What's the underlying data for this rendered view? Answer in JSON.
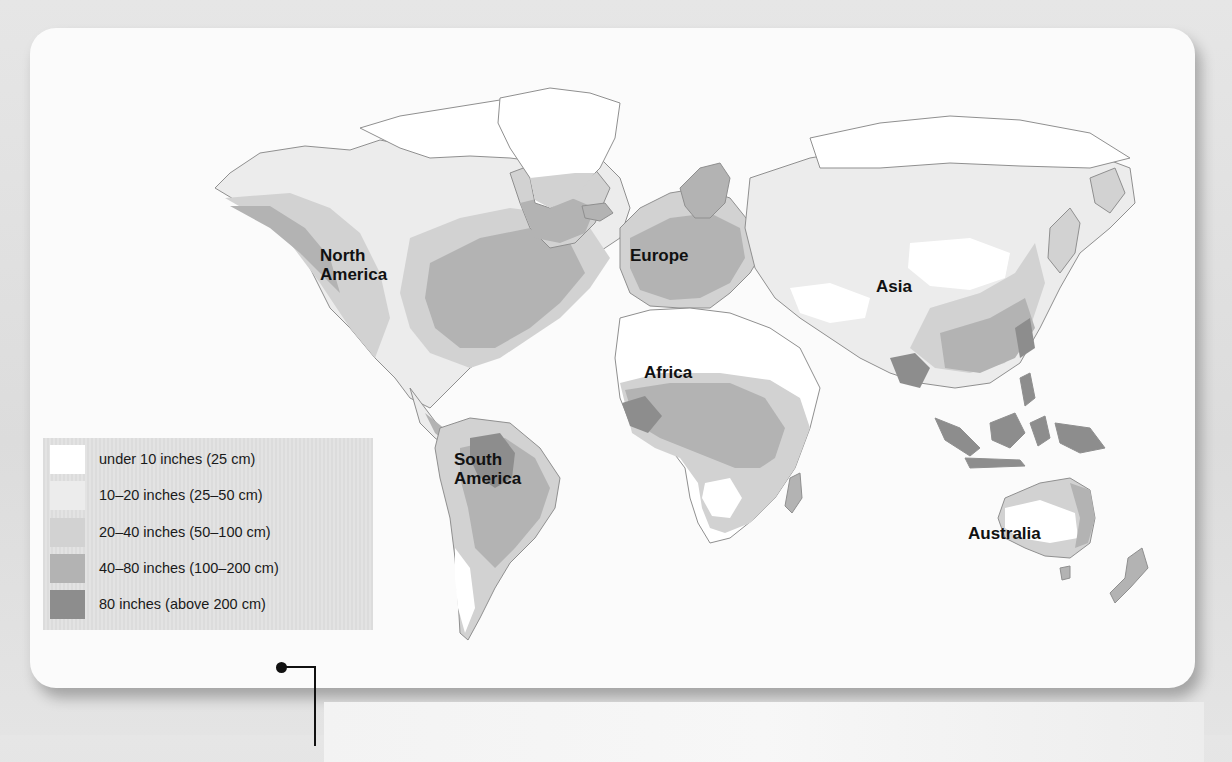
{
  "map": {
    "subject": "World annual precipitation",
    "continent_labels": {
      "north_america": [
        "North",
        "America"
      ],
      "europe": "Europe",
      "asia": "Asia",
      "africa": "Africa",
      "south_america": [
        "South",
        "America"
      ],
      "australia": "Australia"
    }
  },
  "legend": {
    "items": [
      {
        "label": "under 10 inches (25 cm)",
        "color": "#ffffff"
      },
      {
        "label": "10–20 inches (25–50 cm)",
        "color": "#ececec"
      },
      {
        "label": "20–40 inches (50–100 cm)",
        "color": "#d2d2d2"
      },
      {
        "label": "40–80 inches (100–200 cm)",
        "color": "#b3b3b3"
      },
      {
        "label": "80 inches (above 200 cm)",
        "color": "#8d8d8d"
      }
    ]
  },
  "callout": {
    "visible": "partially clipped at bottom edge"
  },
  "colors": {
    "background": "#e2e2e2",
    "card": "#fbfbfb",
    "connector": "#111111"
  }
}
